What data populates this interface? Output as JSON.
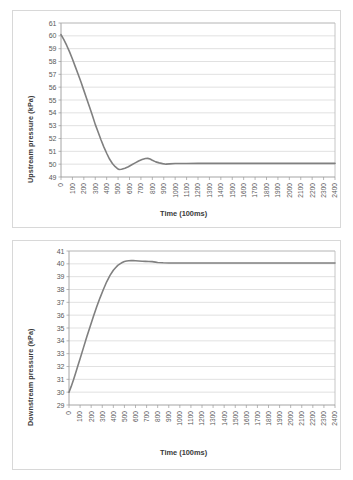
{
  "figure": {
    "background_color": "#ffffff",
    "panel_border_color": "#d8d8d8",
    "series_color": "#808080",
    "gridline_color": "#d4d4d4"
  },
  "chart_data": [
    {
      "id": "upstream",
      "type": "line",
      "title": "",
      "xlabel": "Time (100ms)",
      "ylabel": "Upstream pressure (kPa)",
      "xlim": [
        0,
        2400
      ],
      "ylim": [
        49,
        61
      ],
      "ytick_step": 1,
      "xtick_step": 100,
      "grid": true,
      "legend": "none",
      "yticks": [
        49,
        50,
        51,
        52,
        53,
        54,
        55,
        56,
        57,
        58,
        59,
        60,
        61
      ],
      "xticks": [
        0,
        100,
        200,
        300,
        400,
        500,
        600,
        700,
        800,
        900,
        1000,
        1100,
        1200,
        1300,
        1400,
        1500,
        1600,
        1700,
        1800,
        1900,
        2000,
        2100,
        2200,
        2300,
        2400
      ],
      "series": [
        {
          "name": "Upstream pressure",
          "color": "#808080",
          "x": [
            0,
            25,
            50,
            75,
            100,
            125,
            150,
            175,
            200,
            225,
            250,
            275,
            300,
            325,
            350,
            375,
            400,
            425,
            450,
            475,
            500,
            510,
            530,
            560,
            590,
            620,
            650,
            680,
            710,
            740,
            760,
            780,
            800,
            830,
            860,
            890,
            920,
            950,
            1000,
            1100,
            1200,
            1400,
            1600,
            1800,
            2000,
            2200,
            2400
          ],
          "y": [
            60.1,
            59.7,
            59.25,
            58.75,
            58.2,
            57.6,
            57.0,
            56.4,
            55.75,
            55.1,
            54.45,
            53.8,
            53.1,
            52.5,
            51.9,
            51.35,
            50.85,
            50.4,
            50.05,
            49.8,
            49.62,
            49.58,
            49.6,
            49.68,
            49.8,
            49.95,
            50.1,
            50.25,
            50.36,
            50.44,
            50.45,
            50.4,
            50.3,
            50.18,
            50.1,
            50.04,
            50.0,
            50.02,
            50.05,
            50.05,
            50.06,
            50.06,
            50.06,
            50.06,
            50.06,
            50.06,
            50.06
          ]
        }
      ],
      "annotations": {
        "start_value": 60.1,
        "undershoot_min": 49.6,
        "undershoot_time": 510,
        "overshoot_max": 50.45,
        "overshoot_time": 760,
        "steady_state": 50.05
      }
    },
    {
      "id": "downstream",
      "type": "line",
      "title": "",
      "xlabel": "Time (100ms)",
      "ylabel": "Downstream pressure (kPa)",
      "xlim": [
        0,
        2400
      ],
      "ylim": [
        29,
        41
      ],
      "ytick_step": 1,
      "xtick_step": 100,
      "grid": true,
      "legend": "none",
      "yticks": [
        29,
        30,
        31,
        32,
        33,
        34,
        35,
        36,
        37,
        38,
        39,
        40,
        41
      ],
      "xticks": [
        0,
        100,
        200,
        300,
        400,
        500,
        600,
        700,
        800,
        900,
        1000,
        1100,
        1200,
        1300,
        1400,
        1500,
        1600,
        1700,
        1800,
        1900,
        2000,
        2100,
        2200,
        2300,
        2400
      ],
      "series": [
        {
          "name": "Downstream pressure",
          "color": "#808080",
          "x": [
            0,
            20,
            40,
            60,
            80,
            100,
            130,
            160,
            190,
            220,
            250,
            280,
            310,
            340,
            370,
            400,
            420,
            440,
            460,
            480,
            500,
            520,
            540,
            560,
            580,
            600,
            630,
            660,
            690,
            720,
            750,
            780,
            800,
            850,
            900,
            1000,
            1100,
            1200,
            1400,
            1600,
            1800,
            2000,
            2200,
            2400
          ],
          "y": [
            30.0,
            30.45,
            30.95,
            31.5,
            32.05,
            32.6,
            33.45,
            34.3,
            35.1,
            35.9,
            36.65,
            37.35,
            38.0,
            38.6,
            39.1,
            39.5,
            39.7,
            39.88,
            40.0,
            40.1,
            40.18,
            40.22,
            40.24,
            40.25,
            40.25,
            40.24,
            40.22,
            40.2,
            40.19,
            40.18,
            40.17,
            40.13,
            40.1,
            40.08,
            40.07,
            40.07,
            40.07,
            40.07,
            40.07,
            40.07,
            40.07,
            40.07,
            40.07,
            40.07
          ]
        }
      ],
      "annotations": {
        "start_value": 30.0,
        "overshoot_max": 40.25,
        "overshoot_time": 560,
        "steady_state": 40.07
      }
    }
  ]
}
